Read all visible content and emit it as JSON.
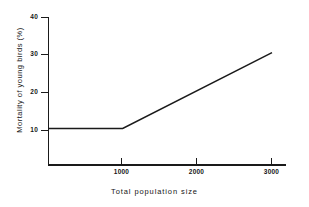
{
  "chart_data": {
    "type": "line",
    "title": "",
    "subtitle": "",
    "xlabel": "Total population size",
    "ylabel": "Mortality of young birds (%)",
    "xlim": [
      0,
      3250
    ],
    "ylim": [
      0,
      40
    ],
    "grid": false,
    "legend": null,
    "xticks": [
      {
        "value": 1000,
        "label": "1000"
      },
      {
        "value": 2000,
        "label": "2000"
      },
      {
        "value": 3000,
        "label": "3000"
      }
    ],
    "yticks": [
      {
        "value": 10,
        "label": "10"
      },
      {
        "value": 20,
        "label": "20"
      },
      {
        "value": 30,
        "label": "30"
      },
      {
        "value": 40,
        "label": "40"
      }
    ],
    "series": [
      {
        "name": "mortality",
        "color": "#1a1a1a",
        "x": [
          0,
          1000,
          3000
        ],
        "values": [
          10,
          10,
          30.5
        ]
      }
    ],
    "annotations": [],
    "breakpoint": {
      "x": 1000,
      "y": 10
    },
    "axis_color": "#1a1a1a",
    "background_color": "#ffffff"
  },
  "axes": {
    "y_title": "Mortality of young birds (%)",
    "x_title": "Total population size",
    "y_tick_labels": [
      "40",
      "30",
      "20",
      "10"
    ],
    "x_tick_labels": [
      "1000",
      "2000",
      "3000"
    ]
  }
}
